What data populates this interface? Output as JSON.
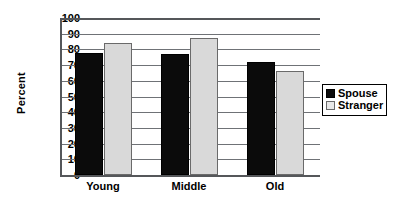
{
  "chart_data": {
    "type": "bar",
    "title": "",
    "xlabel": "",
    "ylabel": "Percent",
    "ylim": [
      0,
      100
    ],
    "ytick_step": 10,
    "yticks": [
      100,
      90,
      80,
      70,
      60,
      50,
      40,
      30,
      20,
      10,
      0
    ],
    "grid": "horizontal",
    "legend_position": "right",
    "categories": [
      "Young",
      "Middle",
      "Old"
    ],
    "series": [
      {
        "name": "Spouse",
        "color": "#0b0b0b",
        "values": [
          78,
          77,
          72
        ]
      },
      {
        "name": "Stranger",
        "color": "#d9d9d9",
        "values": [
          84,
          87,
          66
        ]
      }
    ]
  },
  "axes": {
    "y_title": "Percent",
    "y_tick_labels": [
      "100",
      "90",
      "80",
      "70",
      "60",
      "50",
      "40",
      "30",
      "20",
      "10",
      "0"
    ],
    "x_tick_labels": [
      "Young",
      "Middle",
      "Old"
    ]
  },
  "legend": {
    "entries": [
      {
        "label": "Spouse",
        "swatch": "black-square-icon"
      },
      {
        "label": "Stranger",
        "swatch": "white-square-icon"
      }
    ]
  }
}
